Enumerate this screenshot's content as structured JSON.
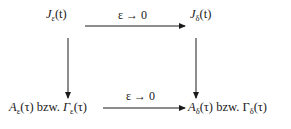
{
  "diagram": {
    "type": "commutative-diagram",
    "nodes": {
      "top_left": {
        "symbol": "J",
        "subscript": "ε",
        "arg": "(t)",
        "tail": ""
      },
      "top_right": {
        "symbol": "J",
        "subscript": "δ",
        "arg": "(t)",
        "tail": ""
      },
      "bottom_left": {
        "symbol": "A",
        "subscript": "ε",
        "arg": "(τ)",
        "connector": " bzw. ",
        "symbol2": "Γ",
        "subscript2": "ε",
        "arg2": "(τ)"
      },
      "bottom_right": {
        "symbol": "A",
        "subscript": "δ",
        "arg": "(τ)",
        "connector": " bzw. ",
        "symbol2": "Γ",
        "subscript2": "δ",
        "arg2": "(τ)"
      }
    },
    "edges": {
      "top": {
        "label": "ε → 0",
        "from": "top_left",
        "to": "top_right"
      },
      "bottom": {
        "label": "ε → 0",
        "from": "bottom_left",
        "to": "bottom_right"
      },
      "left": {
        "label": "",
        "from": "top_left",
        "to": "bottom_left"
      },
      "right": {
        "label": "",
        "from": "top_right",
        "to": "bottom_right"
      }
    },
    "colors": {
      "ink": "#1a1a1a",
      "background": "#ffffff"
    }
  }
}
